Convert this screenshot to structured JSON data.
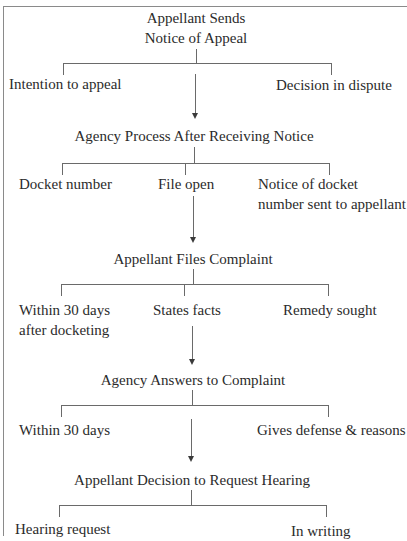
{
  "diagram": {
    "type": "flowchart",
    "title_cutoff": "Agency Appeal Process",
    "stages": [
      {
        "title_lines": [
          "Appellant Sends",
          "Notice of Appeal"
        ],
        "branches": [
          "Intention to appeal",
          "Decision in dispute"
        ]
      },
      {
        "title": "Agency Process After Receiving Notice",
        "branches": [
          "Docket number",
          "File open",
          "Notice of docket number sent to appellant"
        ],
        "branch_lines": {
          "notice_line1": "Notice of docket",
          "notice_line2": "number sent to appellant"
        }
      },
      {
        "title": "Appellant Files Complaint",
        "branches": [
          "Within 30 days after docketing",
          "States facts",
          "Remedy sought"
        ],
        "branch_lines": {
          "within_line1": "Within 30 days",
          "within_line2": "after docketing"
        }
      },
      {
        "title": "Agency Answers to Complaint",
        "branches": [
          "Within 30 days",
          "Gives defense & reasons"
        ]
      },
      {
        "title": "Appellant Decision to Request Hearing",
        "branches": [
          "Hearing request",
          "In writing"
        ]
      }
    ],
    "colors": {
      "line": "#6a6a6a",
      "text": "#2b2b2b",
      "frame": "#8a8a8a",
      "background": "#ffffff"
    }
  }
}
